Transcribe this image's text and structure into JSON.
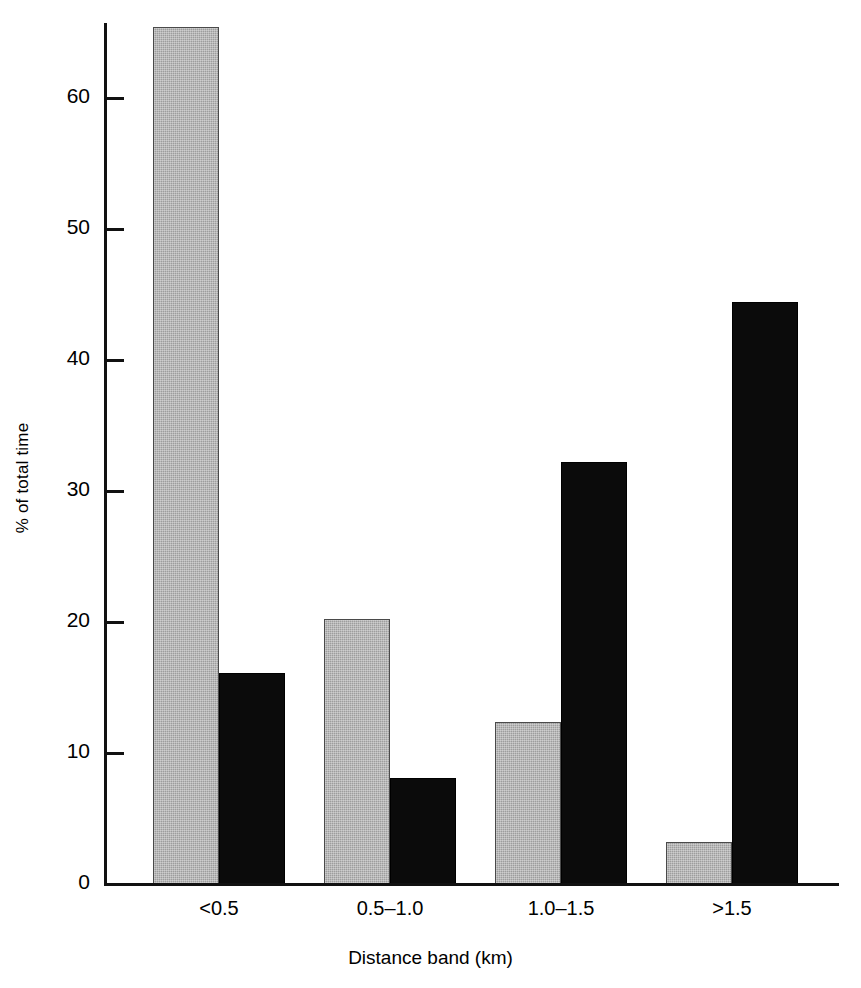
{
  "chart_data": {
    "type": "bar",
    "title": "",
    "subtitle": "",
    "xlabel": "Distance band (km)",
    "ylabel": "% of total time",
    "categories": [
      "<0.5",
      "0.5–1.0",
      "1.0–1.5",
      ">1.5"
    ],
    "series": [
      {
        "name": "light-grey-series",
        "color": "#9d9d9d",
        "values": [
          65.4,
          20.2,
          12.4,
          3.2
        ]
      },
      {
        "name": "black-series",
        "color": "#0b0b0b",
        "values": [
          16.1,
          8.1,
          32.2,
          44.4
        ]
      }
    ],
    "ylim": [
      0,
      66
    ],
    "yticks": [
      0,
      10,
      20,
      30,
      40,
      50,
      60
    ],
    "ytick_labels": [
      "0",
      "10",
      "20",
      "30",
      "40",
      "50",
      "60"
    ],
    "grid": false,
    "legend": "none",
    "axis_color": "#111111"
  },
  "axes": {
    "y_title": "% of total time",
    "x_title": "Distance band (km)"
  }
}
